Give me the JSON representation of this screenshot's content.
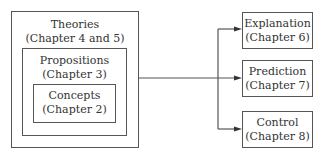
{
  "diagram": {
    "nested": {
      "outer": {
        "title": "Theories",
        "subtitle": "(Chapter 4 and 5)"
      },
      "middle": {
        "title": "Propositions",
        "subtitle": "(Chapter 3)"
      },
      "inner": {
        "title": "Concepts",
        "subtitle": "(Chapter 2)"
      }
    },
    "outputs": [
      {
        "title": "Explanation",
        "subtitle": "(Chapter 6)"
      },
      {
        "title": "Prediction",
        "subtitle": "(Chapter 7)"
      },
      {
        "title": "Control",
        "subtitle": "(Chapter 8)"
      }
    ],
    "line_color": "#555555"
  }
}
